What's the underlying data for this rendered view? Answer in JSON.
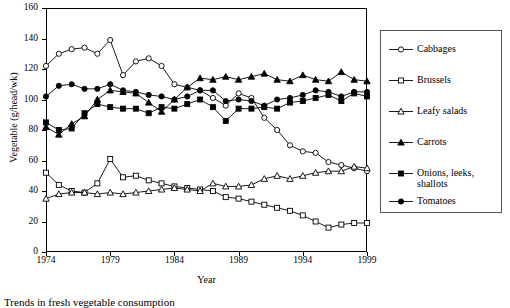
{
  "chart_data": {
    "type": "line",
    "title": "",
    "caption": "Trends in fresh vegetable consumption",
    "xlabel": "Year",
    "ylabel": "Vegetable (g/head/wk)",
    "xlim": [
      1974,
      1999
    ],
    "ylim": [
      0,
      160
    ],
    "xticks": [
      1974,
      1979,
      1984,
      1989,
      1994,
      1999
    ],
    "yticks": [
      0,
      20,
      40,
      60,
      80,
      100,
      120,
      140,
      160
    ],
    "grid": false,
    "legend_position": "right-outside",
    "x": [
      1974,
      1975,
      1976,
      1977,
      1978,
      1979,
      1980,
      1981,
      1982,
      1983,
      1984,
      1985,
      1986,
      1987,
      1988,
      1989,
      1990,
      1991,
      1992,
      1993,
      1994,
      1995,
      1996,
      1997,
      1998,
      1999
    ],
    "series": [
      {
        "name": "Cabbages",
        "marker": "open-circle",
        "values": [
          122,
          130,
          133,
          134,
          130,
          139,
          116,
          125,
          127,
          122,
          110,
          108,
          106,
          101,
          96,
          104,
          101,
          88,
          80,
          70,
          66,
          65,
          59,
          57,
          55,
          53
        ]
      },
      {
        "name": "Brussels",
        "marker": "open-square",
        "values": [
          52,
          44,
          40,
          39,
          45,
          61,
          49,
          50,
          47,
          45,
          43,
          42,
          41,
          40,
          36,
          35,
          33,
          31,
          29,
          27,
          24,
          20,
          16,
          18,
          19,
          19
        ]
      },
      {
        "name": "Leafy salads",
        "marker": "open-triangle",
        "values": [
          35,
          38,
          39,
          39,
          38,
          39,
          38,
          39,
          40,
          41,
          42,
          41,
          40,
          45,
          43,
          43,
          44,
          48,
          50,
          48,
          50,
          52,
          53,
          53,
          56,
          55
        ]
      },
      {
        "name": "Carrots",
        "marker": "filled-triangle",
        "values": [
          82,
          77,
          84,
          89,
          100,
          106,
          105,
          104,
          98,
          92,
          100,
          108,
          114,
          113,
          115,
          113,
          115,
          117,
          113,
          112,
          116,
          113,
          112,
          118,
          113,
          112
        ]
      },
      {
        "name": "Onions, leeks, shallots",
        "marker": "filled-square",
        "values": [
          85,
          80,
          81,
          91,
          97,
          95,
          94,
          94,
          91,
          95,
          94,
          97,
          100,
          95,
          86,
          94,
          94,
          95,
          94,
          98,
          99,
          101,
          103,
          99,
          104,
          102
        ]
      },
      {
        "name": "Tomatoes",
        "marker": "filled-circle",
        "values": [
          102,
          109,
          110,
          107,
          107,
          110,
          106,
          105,
          103,
          102,
          100,
          102,
          106,
          106,
          99,
          100,
          99,
          96,
          100,
          101,
          103,
          106,
          105,
          102,
          105,
          105
        ]
      }
    ]
  }
}
